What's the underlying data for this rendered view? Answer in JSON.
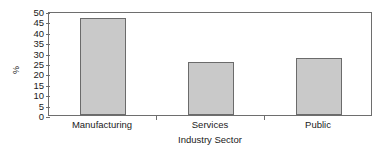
{
  "chart_data": {
    "type": "bar",
    "title": "",
    "subtitle": "",
    "xlabel": "Industry Sector",
    "ylabel": "%",
    "categories": [
      "Manufacturing",
      "Services",
      "Public"
    ],
    "values": [
      46.5,
      25.5,
      27.3
    ],
    "series": [
      {
        "name": "Percent",
        "values": [
          46.5,
          25.5,
          27.3
        ]
      }
    ],
    "ylim": [
      0,
      50
    ],
    "ytick_labels": [
      "50",
      "45",
      "40",
      "35",
      "30",
      "25",
      "20",
      "15",
      "10",
      "5",
      "0"
    ],
    "ytick_values": [
      50,
      45,
      40,
      35,
      30,
      25,
      20,
      15,
      10,
      5,
      0
    ],
    "ytick_interval": 5,
    "grid": false,
    "legend": false,
    "legend_position": "none",
    "annotations": [],
    "bar_fill_color": "#c9c9c9",
    "bar_border_color": "#6b6b6b",
    "axis_color": "#6e6e6e",
    "background_color": "#ffffff"
  }
}
